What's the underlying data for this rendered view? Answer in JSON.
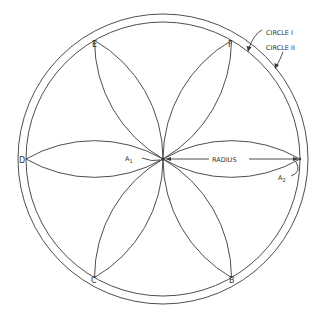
{
  "diagram": {
    "colors": {
      "line": "#3a3a3a",
      "background": "#ffffff"
    },
    "center": {
      "x": 163,
      "y": 159
    },
    "circle_i_radius": 137,
    "circle_ii_radius": 145,
    "points": [
      {
        "id": "D",
        "label": "D"
      },
      {
        "id": "E",
        "label": "E"
      },
      {
        "id": "F",
        "label": "F"
      },
      {
        "id": "B",
        "label": "B"
      },
      {
        "id": "C",
        "label": "C"
      }
    ],
    "labels": {
      "circle_i": "CIRCLE I",
      "circle_ii": "CIRCLE II",
      "radius": "RADIUS",
      "a1": "A",
      "a1_sub": "1",
      "a2": "A",
      "a2_sub": "2"
    }
  }
}
